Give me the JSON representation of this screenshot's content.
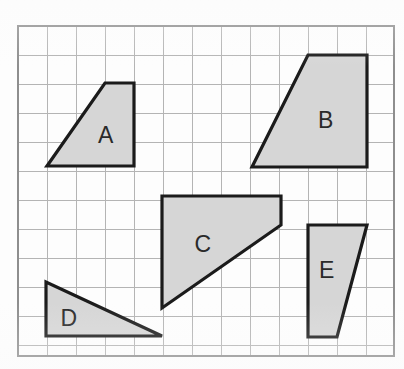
{
  "figure": {
    "canvas": {
      "width": 404,
      "height": 369,
      "background": "#fdfdfd"
    },
    "grid": {
      "x0": 18,
      "y0": 26,
      "x1": 394,
      "y1": 356,
      "cell_size": 29,
      "columns": 13,
      "rows": 11,
      "line_color": "#b4b4b4",
      "border_color": "#8e8e8e"
    },
    "style": {
      "fill_color": "#d6d6d6",
      "outline_color": "#1b1b1b",
      "outline_width": 3.2,
      "label_color": "#2a2a2a",
      "label_font_size": 23
    },
    "shapes": [
      {
        "id": "A",
        "label": "A",
        "kind": "trapezoid",
        "points": "105,83 134,83 134,166 47,166",
        "label_x": 106,
        "label_y": 137
      },
      {
        "id": "B",
        "label": "B",
        "kind": "trapezoid",
        "points": "308,55 367,55 367,167 252,167",
        "label_x": 326,
        "label_y": 122
      },
      {
        "id": "C",
        "label": "C",
        "kind": "quadrilateral",
        "points": "162,196 281,196 281,225 162,308",
        "label_x": 203,
        "label_y": 246
      },
      {
        "id": "D",
        "label": "D",
        "kind": "triangle",
        "points": "46,282 46,336 162,336",
        "label_x": 69,
        "label_y": 320
      },
      {
        "id": "E",
        "label": "E",
        "kind": "trapezoid",
        "points": "308,225 367,225 337,337 308,337",
        "label_x": 327,
        "label_y": 272
      }
    ]
  }
}
